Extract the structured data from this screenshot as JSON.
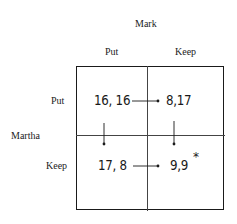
{
  "column_player": {
    "name": "Mark",
    "strategies": [
      "Put",
      "Keep"
    ]
  },
  "row_player": {
    "name": "Martha",
    "strategies": [
      "Put",
      "Keep"
    ]
  },
  "cells": {
    "put_put": "16, 16",
    "put_keep": "8,17",
    "keep_put": "17, 8",
    "keep_keep": "9,9"
  },
  "equilibrium_marker": "*",
  "arrows": [
    {
      "from": "put_put",
      "to": "put_keep",
      "direction": "right"
    },
    {
      "from": "keep_put",
      "to": "keep_keep",
      "direction": "right"
    },
    {
      "from": "put_put",
      "to": "keep_put",
      "direction": "down"
    },
    {
      "from": "put_keep",
      "to": "keep_keep",
      "direction": "down"
    }
  ],
  "equilibrium": "keep_keep"
}
